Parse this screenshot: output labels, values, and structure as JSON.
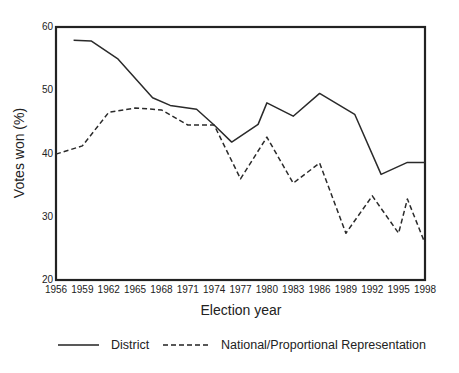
{
  "chart_data": {
    "type": "line",
    "title": "",
    "xlabel": "Election year",
    "ylabel": "Votes won (%)",
    "xlim": [
      1956,
      1998
    ],
    "ylim": [
      20,
      60
    ],
    "x_ticks": [
      "1956",
      "1959",
      "1962",
      "1965",
      "1968",
      "1971",
      "1974",
      "1977",
      "1980",
      "1983",
      "1986",
      "1989",
      "1992",
      "1995",
      "1998"
    ],
    "y_ticks": [
      "20",
      "30",
      "40",
      "50",
      "60"
    ],
    "grid": false,
    "legend_position": "bottom",
    "series": [
      {
        "name": "District",
        "style": "solid",
        "x": [
          1958,
          1960,
          1963,
          1967,
          1969,
          1972,
          1974,
          1976,
          1979,
          1980,
          1983,
          1986,
          1990,
          1993,
          1996,
          1998
        ],
        "values": [
          57.9,
          57.8,
          55.0,
          48.8,
          47.6,
          47.0,
          44.5,
          41.8,
          44.6,
          48.0,
          45.9,
          49.5,
          46.2,
          36.7,
          38.6,
          38.6
        ]
      },
      {
        "name": "National/Proportional Representation",
        "style": "dashed",
        "x": [
          1956,
          1959,
          1962,
          1965,
          1968,
          1971,
          1974,
          1977,
          1980,
          1983,
          1986,
          1989,
          1992,
          1995,
          1996,
          1998
        ],
        "values": [
          39.9,
          41.2,
          46.5,
          47.2,
          46.9,
          44.5,
          44.5,
          36.0,
          42.6,
          35.3,
          38.5,
          27.4,
          33.3,
          27.4,
          32.8,
          25.8
        ]
      }
    ]
  }
}
